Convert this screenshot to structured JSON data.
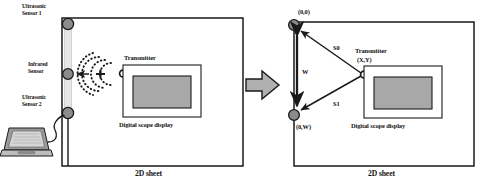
{
  "figure": {
    "panels": [
      {
        "id": "physical-setup",
        "caption": "2D sheet",
        "labels": {
          "ultrasonic_sensor_1": "Ultrasonic\nSensor 1",
          "ultrasonic_sensor_1_line1": "Ultrasonic",
          "ultrasonic_sensor_1_line2": "Sensor 1",
          "infrared_sensor_line1": "Infrared",
          "infrared_sensor_line2": "Sensor",
          "ultrasonic_sensor_2_line1": "Ultrasonic",
          "ultrasonic_sensor_2_line2": "Sensor 2",
          "transmitter": "Transmitter",
          "digital_scope_display": "Digital scope   display"
        }
      },
      {
        "id": "geometric-model",
        "caption": "2D sheet",
        "labels": {
          "origin": "(0,0)",
          "bottom_corner": "(0,W)",
          "distance_s0": "S0",
          "distance_s1": "S1",
          "baseline_w": "W",
          "transmitter": "Transmitter",
          "transmitter_coords": "(X,Y)",
          "digital_scope_display": "Digital scope   display"
        }
      }
    ],
    "icons": {
      "laptop": "laptop-icon",
      "transition_arrow": "right-block-arrow-icon",
      "sensor_node": "sensor-node-icon",
      "transmitter_marker": "transmitter-circle-icon",
      "wave": "ultrasonic-wave-icon"
    },
    "colors": {
      "stroke": "#1a1a1a",
      "sensor_fill": "#8c8c8c",
      "rail_fill": "#e4e4e4",
      "screen_fill": "#a8a8a8",
      "arrow_fill": "#b0b0b0",
      "page_bg": "#ffffff"
    }
  }
}
